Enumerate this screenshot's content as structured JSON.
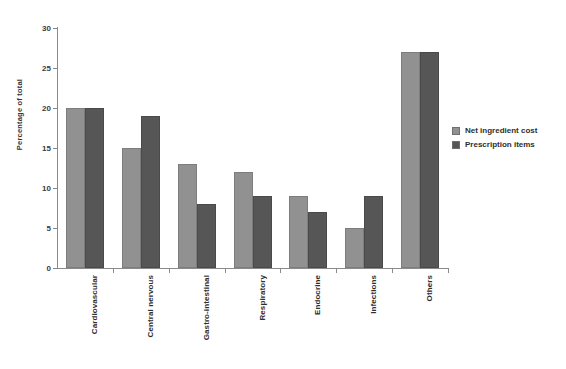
{
  "chart_data": {
    "type": "bar",
    "title": "",
    "subtitle": "",
    "xlabel": "",
    "ylabel": "Percentage of total",
    "ylim": [
      0,
      30
    ],
    "ytick_step": 5,
    "yticks": [
      "0",
      "5",
      "10",
      "15",
      "20",
      "25",
      "30"
    ],
    "grid": false,
    "legend_position": "right",
    "categories": [
      "Cardiovascular",
      "Central nervous",
      "Gastro-intestinal",
      "Respiratory",
      "Endocrine",
      "Infections",
      "Others"
    ],
    "series": [
      {
        "name": "Net ingredient cost",
        "color": "#919191",
        "values": [
          20,
          15,
          13,
          12,
          9,
          5,
          27
        ]
      },
      {
        "name": "Prescription items",
        "color": "#565656",
        "values": [
          20,
          19,
          8,
          9,
          7,
          9,
          27
        ]
      }
    ]
  },
  "legend": {
    "items": [
      {
        "label": "Net ingredient cost"
      },
      {
        "label": "Prescription items"
      }
    ]
  }
}
